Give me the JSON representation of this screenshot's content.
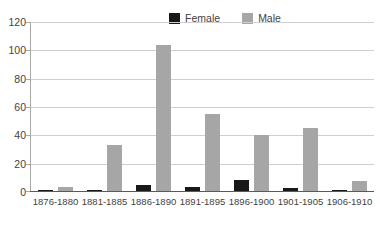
{
  "chart_data": {
    "type": "bar",
    "title": "",
    "xlabel": "",
    "ylabel": "",
    "categories": [
      "1876-1880",
      "1881-1885",
      "1886-1890",
      "1891-1895",
      "1896-1900",
      "1901-1905",
      "1906-1910"
    ],
    "series": [
      {
        "name": "Female",
        "color": "#181818",
        "values": [
          1,
          1,
          4,
          3,
          8,
          2,
          1
        ]
      },
      {
        "name": "Male",
        "color": "#a6a6a6",
        "values": [
          3,
          33,
          104,
          55,
          40,
          45,
          7
        ]
      }
    ],
    "ylim": [
      0,
      120
    ],
    "yticks": [
      0,
      20,
      40,
      60,
      80,
      100,
      120
    ],
    "ytick_labels": [
      "0",
      "20",
      "40",
      "60",
      "80",
      "100",
      "120"
    ],
    "grid": true,
    "grid_axis": "y",
    "legend": true,
    "legend_position": "top-center"
  },
  "legend": {
    "entries": [
      {
        "label": "Female",
        "swatch": "legend-swatch-female"
      },
      {
        "label": "Male",
        "swatch": "legend-swatch-male"
      }
    ]
  },
  "colors": {
    "female": "#181818",
    "male": "#a6a6a6",
    "gridline": "#cfcfcf",
    "axis": "#5a5a5a",
    "text": "#3f3f3f",
    "background": "#ffffff"
  }
}
